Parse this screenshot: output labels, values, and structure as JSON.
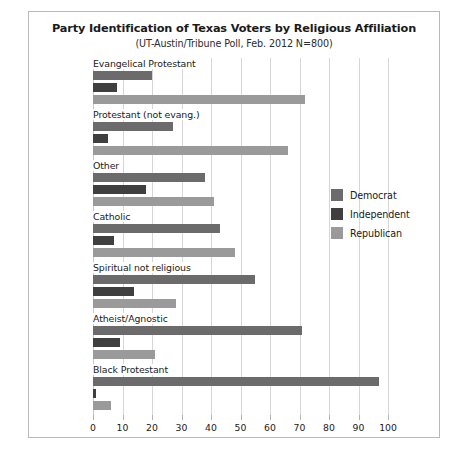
{
  "chart_data": {
    "type": "bar",
    "orientation": "horizontal",
    "title": "Party Identification of Texas Voters by Religious Affiliation",
    "subtitle": "(UT-Austin/Tribune Poll, Feb. 2012 N=800)",
    "xlabel": "",
    "ylabel": "",
    "xlim": [
      0,
      100
    ],
    "xticks": [
      0,
      10,
      20,
      30,
      40,
      50,
      60,
      70,
      80,
      90,
      100
    ],
    "grid": true,
    "legend_position": "middle-right",
    "categories": [
      "Evangelical Protestant",
      "Protestant (not evang.)",
      "Other",
      "Catholic",
      "Spiritual not religious",
      "Atheist/Agnostic",
      "Black Protestant"
    ],
    "series": [
      {
        "name": "Democrat",
        "color": "#6b6b6b",
        "values": [
          20,
          27,
          38,
          43,
          55,
          71,
          97
        ]
      },
      {
        "name": "Independent",
        "color": "#3f3f3f",
        "values": [
          8,
          5,
          18,
          7,
          14,
          9,
          1
        ]
      },
      {
        "name": "Republican",
        "color": "#9a9a9a",
        "values": [
          72,
          66,
          41,
          48,
          28,
          21,
          6
        ]
      }
    ]
  },
  "legend": {
    "items": [
      {
        "label": "Democrat",
        "color": "#6b6b6b"
      },
      {
        "label": "Independent",
        "color": "#3f3f3f"
      },
      {
        "label": "Republican",
        "color": "#9a9a9a"
      }
    ]
  },
  "colors": {
    "democrat": "#6b6b6b",
    "independent": "#3f3f3f",
    "republican": "#9a9a9a",
    "gridline": "#d6d6d6",
    "frame_border": "#b9b9b9",
    "text": "#1a1a1a",
    "background": "#ffffff"
  }
}
